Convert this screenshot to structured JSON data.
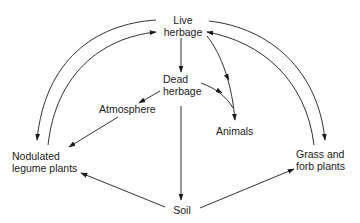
{
  "diagram": {
    "type": "flow-cycle",
    "colors": {
      "line": "#1a1a1a",
      "text": "#1a1a1a",
      "background": "#ffffff"
    },
    "nodes": {
      "live_herbage": {
        "line1": "Live",
        "line2": "herbage"
      },
      "dead_herbage": {
        "line1": "Dead",
        "line2": "herbage"
      },
      "atmosphere": {
        "line1": "Atmosphere"
      },
      "animals": {
        "line1": "Animals"
      },
      "nodulated_legume": {
        "line1": "Nodulated",
        "line2": "legume plants"
      },
      "grass_forb": {
        "line1": "Grass and",
        "line2": "forb plants"
      },
      "soil": {
        "line1": "Soil"
      }
    },
    "edges": [
      {
        "from": "Live herbage",
        "to": "Nodulated legume plants"
      },
      {
        "from": "Nodulated legume plants",
        "to": "Live herbage"
      },
      {
        "from": "Live herbage",
        "to": "Grass and forb plants"
      },
      {
        "from": "Grass and forb plants",
        "to": "Live herbage"
      },
      {
        "from": "Live herbage",
        "to": "Dead herbage"
      },
      {
        "from": "Live herbage",
        "to": "Animals"
      },
      {
        "from": "Dead herbage",
        "to": "Animals"
      },
      {
        "from": "Dead herbage",
        "to": "Atmosphere"
      },
      {
        "from": "Atmosphere",
        "to": "Nodulated legume plants"
      },
      {
        "from": "Dead herbage",
        "to": "Soil"
      },
      {
        "from": "Soil",
        "to": "Nodulated legume plants"
      },
      {
        "from": "Soil",
        "to": "Grass and forb plants"
      }
    ]
  }
}
